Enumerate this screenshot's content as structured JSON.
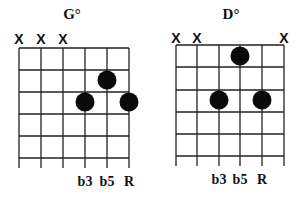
{
  "diagrams": [
    {
      "title": "G°",
      "strings": 6,
      "frets": 5,
      "muted": [
        "X",
        "X",
        "X",
        "",
        "",
        ""
      ],
      "dots": [
        {
          "string": 4,
          "fret": 3
        },
        {
          "string": 5,
          "fret": 2
        },
        {
          "string": 6,
          "fret": 3
        }
      ],
      "labels": [
        "",
        "",
        "",
        "b3",
        "b5",
        "R"
      ]
    },
    {
      "title": "D°",
      "strings": 6,
      "frets": 5,
      "muted": [
        "X",
        "X",
        "",
        "",
        "",
        "X"
      ],
      "dots": [
        {
          "string": 3,
          "fret": 2
        },
        {
          "string": 4,
          "fret": 1
        },
        {
          "string": 5,
          "fret": 2
        }
      ],
      "labels": [
        "",
        "",
        "b3",
        "b5",
        "R",
        ""
      ]
    }
  ]
}
